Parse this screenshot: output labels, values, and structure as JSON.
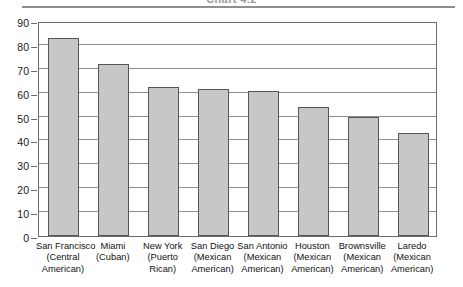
{
  "title_strip": {
    "cutoff_title": "Chart 4.2"
  },
  "chart_data": {
    "type": "bar",
    "title": "Chart 4.2",
    "xlabel": "",
    "ylabel": "",
    "ylim": [
      0,
      90
    ],
    "ytick_step": 10,
    "yticks": [
      0,
      10,
      20,
      30,
      40,
      50,
      60,
      70,
      80,
      90
    ],
    "grid": true,
    "legend": "none",
    "bar_fill_color": "#c7c7c7",
    "bar_border_color": "#555555",
    "axis_color": "#6d6d6d",
    "categories": [
      "San Francisco (Central American)",
      "Miami (Cuban)",
      "New York (Puerto Rican)",
      "San Diego (Mexican American)",
      "San Antonio (Mexican American)",
      "Houston (Mexican American)",
      "Brownsville (Mexican American)",
      "Laredo (Mexican American)"
    ],
    "category_lines": [
      [
        "San Francisco",
        "(Central",
        "American)"
      ],
      [
        "Miami",
        "(Cuban)"
      ],
      [
        "New York",
        "(Puerto",
        "Rican)"
      ],
      [
        "San Diego",
        "(Mexican",
        "American)"
      ],
      [
        "San Antonio",
        "(Mexican",
        "American)"
      ],
      [
        "Houston",
        "(Mexican",
        "American)"
      ],
      [
        "Brownsville",
        "(Mexican",
        "American)"
      ],
      [
        "Laredo",
        "(Mexican",
        "American)"
      ]
    ],
    "values": [
      83,
      72,
      62.5,
      61.5,
      60.5,
      54,
      50,
      43
    ]
  }
}
